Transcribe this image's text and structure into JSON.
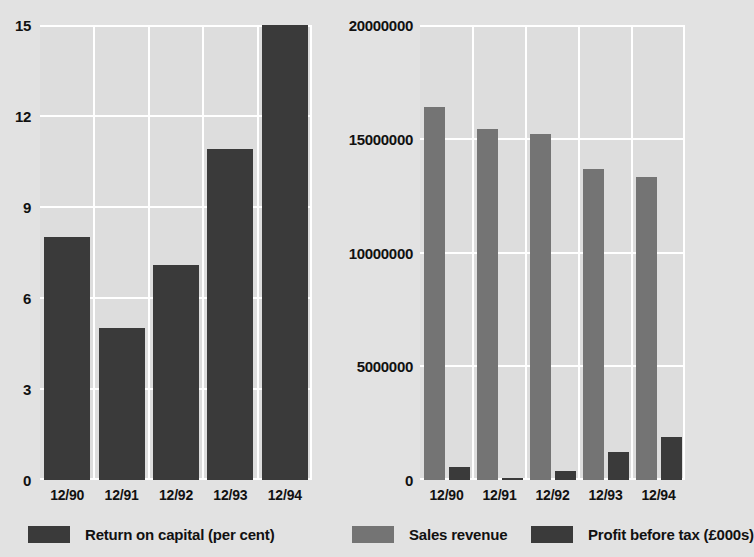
{
  "chart_data": [
    {
      "type": "bar",
      "id": "return-on-capital",
      "title": "",
      "xlabel": "",
      "ylabel": "",
      "categories": [
        "12/90",
        "12/91",
        "12/92",
        "12/93",
        "12/94"
      ],
      "ytick_labels": [
        "15",
        "12",
        "9",
        "6",
        "3",
        "0"
      ],
      "ytick_values": [
        15,
        12,
        9,
        6,
        3,
        0
      ],
      "ylim": [
        0,
        15
      ],
      "grid": true,
      "legend_position": "bottom",
      "series": [
        {
          "name": "Return on capital (per cent)",
          "color": "#3a3a3a",
          "values": [
            8.0,
            5.0,
            7.1,
            10.9,
            15.0
          ]
        }
      ]
    },
    {
      "type": "bar",
      "id": "sales-and-profit",
      "title": "",
      "xlabel": "",
      "ylabel": "",
      "categories": [
        "12/90",
        "12/91",
        "12/92",
        "12/93",
        "12/94"
      ],
      "ytick_labels": [
        "20000000",
        "15000000",
        "10000000",
        "5000000",
        "0"
      ],
      "ytick_values": [
        20000000,
        15000000,
        10000000,
        5000000,
        0
      ],
      "ylim": [
        0,
        20000000
      ],
      "grid": true,
      "legend_position": "bottom",
      "series": [
        {
          "name": "Sales revenue",
          "color": "#747474",
          "values": [
            16400000,
            15450000,
            15200000,
            13650000,
            13300000
          ]
        },
        {
          "name": "Profit before tax  (£000s)",
          "color": "#3a3a3a",
          "values": [
            570000,
            100000,
            390000,
            1250000,
            1880000
          ]
        }
      ]
    }
  ],
  "left_chart": {
    "yticks": [
      "15",
      "12",
      "9",
      "6",
      "3",
      "0"
    ],
    "xticks": [
      "12/90",
      "12/91",
      "12/92",
      "12/93",
      "12/94"
    ]
  },
  "right_chart": {
    "yticks": [
      "20000000",
      "15000000",
      "10000000",
      "5000000",
      "0"
    ],
    "xticks": [
      "12/90",
      "12/91",
      "12/92",
      "12/93",
      "12/94"
    ]
  },
  "legend": {
    "items": [
      {
        "label": "Return on capital (per cent)",
        "color": "#3a3a3a"
      },
      {
        "label": "Sales revenue",
        "color": "#747474"
      },
      {
        "label": "Profit before tax  (£000s)",
        "color": "#3a3a3a"
      }
    ]
  },
  "colors": {
    "background": "#e2e2e2",
    "plot_background": "#dddddd",
    "grid": "#ffffff",
    "dark_bar": "#3a3a3a",
    "mid_bar": "#747474",
    "text": "#111111"
  }
}
